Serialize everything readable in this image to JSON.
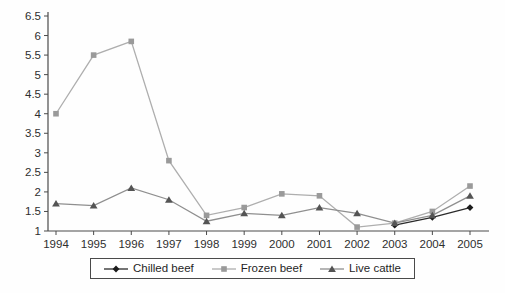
{
  "chart_data": {
    "type": "line",
    "title": "",
    "xlabel": "",
    "ylabel": "",
    "x": [
      1994,
      1995,
      1996,
      1997,
      1998,
      1999,
      2000,
      2001,
      2002,
      2003,
      2004,
      2005
    ],
    "ylim": [
      1,
      6.5
    ],
    "ytick_step": 0.5,
    "ytick_labels": [
      "1",
      "1.5",
      "2",
      "2.5",
      "3",
      "3.5",
      "4",
      "4.5",
      "5",
      "5.5",
      "6",
      "6.5"
    ],
    "grid": false,
    "legend_position": "bottom-center",
    "axis_color": "#4a4a4a",
    "series": [
      {
        "name": "Chilled beef",
        "marker": "diamond",
        "marker_color": "#1c1c1c",
        "line_color": "#2a2a2a",
        "values": [
          null,
          null,
          null,
          null,
          null,
          null,
          null,
          null,
          null,
          1.15,
          1.35,
          1.6
        ]
      },
      {
        "name": "Frozen beef",
        "marker": "square",
        "marker_color": "#9a9a9a",
        "line_color": "#aeaeae",
        "values": [
          4.0,
          5.5,
          5.85,
          2.8,
          1.4,
          1.6,
          1.95,
          1.9,
          1.1,
          1.2,
          1.5,
          2.15
        ]
      },
      {
        "name": "Live cattle",
        "marker": "triangle",
        "marker_color": "#545454",
        "line_color": "#8f8f8f",
        "values": [
          1.7,
          1.65,
          2.1,
          1.8,
          1.25,
          1.45,
          1.4,
          1.6,
          1.45,
          1.2,
          1.4,
          1.9
        ]
      }
    ]
  }
}
